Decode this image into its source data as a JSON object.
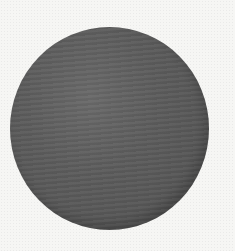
{
  "scene": {
    "background_color": "#f6f6f4",
    "shape": "circle",
    "shape_color": "#555555",
    "shape_highlight_color": "#6a6a6a",
    "shape_shadow_color": "#4a4a4a"
  }
}
